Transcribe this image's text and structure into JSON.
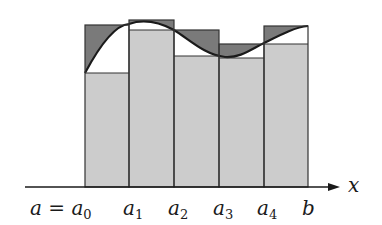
{
  "diagram": {
    "axis": {
      "label": "x",
      "y": 187,
      "x_start": 25,
      "x_end": 340
    },
    "colors": {
      "lower_rect": "#cccccc",
      "upper_excess": "#7a7a7a",
      "curve": "#1a1a1a",
      "outline": "#333333"
    },
    "partition": [
      {
        "x": 85,
        "base": "a",
        "sub": "0",
        "label_prefix": "a = ",
        "label_x": 30
      },
      {
        "x": 129,
        "base": "a",
        "sub": "1",
        "label_x": 123
      },
      {
        "x": 174,
        "base": "a",
        "sub": "2",
        "label_x": 168
      },
      {
        "x": 219,
        "base": "a",
        "sub": "3",
        "label_x": 213
      },
      {
        "x": 264,
        "base": "a",
        "sub": "4",
        "label_x": 257
      },
      {
        "x": 308,
        "base": "b",
        "sub": "",
        "label_x": 302
      }
    ],
    "bars": [
      {
        "x0": 85,
        "x1": 129,
        "upper_top": 25,
        "lower_top": 73
      },
      {
        "x0": 129,
        "x1": 174,
        "upper_top": 20,
        "lower_top": 30
      },
      {
        "x0": 174,
        "x1": 219,
        "upper_top": 30,
        "lower_top": 56
      },
      {
        "x0": 219,
        "x1": 264,
        "upper_top": 44,
        "lower_top": 58
      },
      {
        "x0": 264,
        "x1": 308,
        "upper_top": 26,
        "lower_top": 44
      }
    ],
    "curve_path": "M85,73 C100,45 115,25 129,24 C140,20 155,20 174,30 C190,40 205,55 225,57 C240,58 250,50 264,43 C280,35 295,27 308,26"
  }
}
